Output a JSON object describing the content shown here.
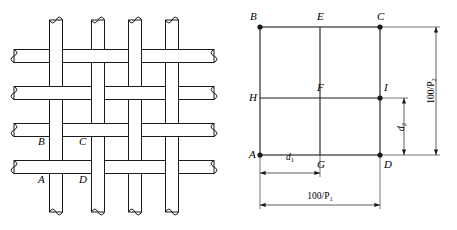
{
  "figure": {
    "type": "technical-diagram",
    "line_color": "#1a1a1a",
    "background": "#ffffff"
  },
  "weave_diagram": {
    "name": "plain-weave-structure",
    "warp_count": 4,
    "weft_count": 4,
    "weave_type": "plain",
    "labels": [
      {
        "id": "B",
        "text": "B",
        "x": 38,
        "y": 145
      },
      {
        "id": "C",
        "text": "C",
        "x": 79,
        "y": 145
      },
      {
        "id": "A",
        "text": "A",
        "x": 38,
        "y": 183
      },
      {
        "id": "D",
        "text": "D",
        "x": 79,
        "y": 183
      }
    ],
    "warp_x": [
      56,
      98,
      135,
      172
    ],
    "weft_y": [
      56,
      93,
      130,
      167
    ],
    "yarn_width": 13
  },
  "geometry_diagram": {
    "name": "unit-cell-geometry",
    "grid": {
      "left": 32,
      "right": 152,
      "top": 27,
      "bottom": 155,
      "mid_x": 92,
      "mid_y": 98
    },
    "points": [
      {
        "id": "B",
        "label": "B",
        "x": 32,
        "y": 27,
        "dot": true,
        "lx": 22,
        "ly": 20
      },
      {
        "id": "E",
        "label": "E",
        "x": 92,
        "y": 27,
        "dot": false,
        "lx": 89,
        "ly": 20
      },
      {
        "id": "C",
        "label": "C",
        "x": 152,
        "y": 27,
        "dot": true,
        "lx": 149,
        "ly": 20
      },
      {
        "id": "H",
        "label": "H",
        "x": 32,
        "y": 98,
        "dot": false,
        "lx": 21,
        "ly": 101
      },
      {
        "id": "F",
        "label": "F",
        "x": 92,
        "y": 98,
        "dot": false,
        "lx": 89,
        "ly": 91
      },
      {
        "id": "I",
        "label": "I",
        "x": 152,
        "y": 98,
        "dot": true,
        "lx": 156,
        "ly": 91
      },
      {
        "id": "A",
        "label": "A",
        "x": 32,
        "y": 155,
        "dot": true,
        "lx": 21,
        "ly": 158
      },
      {
        "id": "G",
        "label": "G",
        "x": 92,
        "y": 155,
        "dot": false,
        "lx": 89,
        "ly": 168
      },
      {
        "id": "D",
        "label": "D",
        "x": 152,
        "y": 155,
        "dot": true,
        "lx": 156,
        "ly": 168
      }
    ],
    "dimensions": [
      {
        "name": "warp-spacing-d1",
        "symbol": "d",
        "subscript": "1",
        "orientation": "horizontal",
        "from": "A",
        "to": "G",
        "label_x": 62,
        "label_y": 160
      },
      {
        "name": "weft-spacing-d2",
        "symbol": "d",
        "subscript": "2",
        "orientation": "vertical",
        "from": "I",
        "to": "D",
        "label_x": 176,
        "label_y": 127
      },
      {
        "name": "warp-pitch",
        "text": "100/P",
        "subscript": "1",
        "orientation": "horizontal",
        "from": "A",
        "to": "D",
        "label_x": 92,
        "label_y": 199
      },
      {
        "name": "weft-pitch",
        "text": "100/P",
        "subscript": "2",
        "orientation": "vertical",
        "from": "C",
        "to": "D",
        "label_x": 206,
        "label_y": 91
      }
    ]
  }
}
